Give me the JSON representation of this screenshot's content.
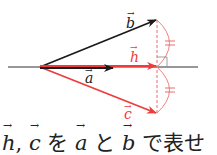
{
  "diagram": {
    "labels": {
      "a": "a",
      "b": "b",
      "h": "h",
      "c": "c"
    },
    "colors": {
      "black": "#1a1a1a",
      "red": "#ee3b3b",
      "red_light": "#f08080"
    },
    "tick_mark": "="
  },
  "caption": {
    "h": "h",
    "sep": ",",
    "c": "c",
    "wo": "を",
    "a": "a",
    "to": "と",
    "b": "b",
    "rest": "で表せ"
  }
}
